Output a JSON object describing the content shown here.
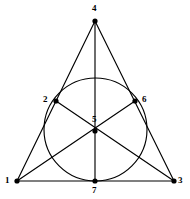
{
  "figure": {
    "background_color": "#ffffff",
    "stroke_color": "#000000",
    "label_color": "#000000",
    "width": 190,
    "height": 199
  },
  "chart_data": {
    "type": "diagram",
    "xlabel": "",
    "ylabel": "",
    "grid": false,
    "legend": null,
    "xlim": [
      0,
      190
    ],
    "ylim": [
      0,
      199
    ],
    "points": [
      {
        "id": "1",
        "label": "1",
        "x": 17,
        "y": 181,
        "label_x": 5,
        "label_y": 176
      },
      {
        "id": "2",
        "label": "2",
        "x": 56,
        "y": 101,
        "label_x": 43,
        "label_y": 95
      },
      {
        "id": "3",
        "label": "3",
        "x": 174,
        "y": 181,
        "label_x": 178,
        "label_y": 176
      },
      {
        "id": "4",
        "label": "4",
        "x": 95,
        "y": 21,
        "label_x": 92,
        "label_y": 4
      },
      {
        "id": "5",
        "label": "5",
        "x": 95,
        "y": 131,
        "label_x": 92,
        "label_y": 115
      },
      {
        "id": "6",
        "label": "6",
        "x": 135,
        "y": 101,
        "label_x": 142,
        "label_y": 95
      },
      {
        "id": "7",
        "label": "7",
        "x": 95,
        "y": 181,
        "label_x": 92,
        "label_y": 186
      }
    ],
    "segments": [
      {
        "name": "line-1-2-4",
        "points": [
          "1",
          "4"
        ]
      },
      {
        "name": "line-4-6-3",
        "points": [
          "4",
          "3"
        ]
      },
      {
        "name": "line-1-7-3",
        "points": [
          "1",
          "3"
        ]
      },
      {
        "name": "line-4-5-7",
        "points": [
          "4",
          "7"
        ]
      },
      {
        "name": "line-1-5-6",
        "points": [
          "1",
          "6"
        ]
      },
      {
        "name": "line-3-5-2",
        "points": [
          "3",
          "2"
        ]
      }
    ],
    "circle": {
      "name": "circle-2-5-6-7",
      "cx": 95.5,
      "cy": 129.5,
      "r": 51.5,
      "through": [
        "2",
        "6",
        "7"
      ]
    },
    "dot_radius": 2.6
  }
}
